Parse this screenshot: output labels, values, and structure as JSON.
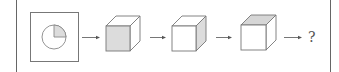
{
  "diagram": {
    "start": {
      "type": "framed-circle",
      "shaded_sector": "top-right quarter"
    },
    "sequence": [
      {
        "type": "cube",
        "shaded_face": "front"
      },
      {
        "type": "cube",
        "shaded_face": "right"
      },
      {
        "type": "cube",
        "shaded_face": "top"
      }
    ],
    "question_mark": "?",
    "colors": {
      "line": "#6b6b6b",
      "shade": "#dcdcdc",
      "border": "#555555"
    }
  }
}
